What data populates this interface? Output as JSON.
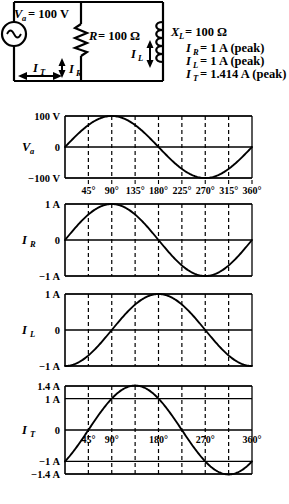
{
  "circuit": {
    "source": {
      "label_var": "V",
      "label_sub": "a",
      "label_value": "= 100 V",
      "icon": "ac-source-icon"
    },
    "resistor": {
      "label_var": "R",
      "label_value": "= 100 Ω",
      "icon": "resistor-icon"
    },
    "inductor": {
      "label_var": "X",
      "label_sub": "L",
      "label_value": "= 100 Ω",
      "icon": "inductor-icon"
    },
    "current_total": {
      "var": "I",
      "sub": "T"
    },
    "current_r": {
      "var": "I",
      "sub": "R"
    },
    "current_l": {
      "var": "I",
      "sub": "L"
    },
    "legend": [
      {
        "var": "I",
        "sub": "R",
        "text": "= 1 A (peak)"
      },
      {
        "var": "I",
        "sub": "L",
        "text": "= 1 A (peak)"
      },
      {
        "var": "I",
        "sub": "T",
        "text": "= 1.414 A (peak)"
      }
    ]
  },
  "chart_data": {
    "type": "line",
    "title": "",
    "xlabel": "",
    "x_unit": "degrees",
    "x": [
      0,
      45,
      90,
      135,
      180,
      225,
      270,
      315,
      360
    ],
    "xticklabels": [
      "45°",
      "90°",
      "135°",
      "180°",
      "225°",
      "270°",
      "315°",
      "360°"
    ],
    "xticks_values": [
      45,
      90,
      135,
      180,
      225,
      270,
      315,
      360
    ],
    "grid": true,
    "legend_position": "none",
    "panels": [
      {
        "name": "V_a",
        "ylabel_var": "V",
        "ylabel_sub": "a",
        "ylim": [
          -100,
          100
        ],
        "yticklabels": [
          "100 V",
          "0",
          "−100 V"
        ],
        "ytick_values": [
          100,
          0,
          -100
        ],
        "amplitude": 100,
        "phase_deg": 0,
        "waveform": "100*sin(theta)",
        "xticklabels_shown": true,
        "xticklabels": [
          "45°",
          "90°",
          "135°",
          "180°",
          "225°",
          "270°",
          "315°",
          "360°"
        ],
        "values": [
          0,
          70.7,
          100,
          70.7,
          0,
          -70.7,
          -100,
          -70.7,
          0
        ]
      },
      {
        "name": "I_R",
        "ylabel_var": "I",
        "ylabel_sub": "R",
        "ylim": [
          -1,
          1
        ],
        "yticklabels": [
          "1 A",
          "0",
          "−1 A"
        ],
        "ytick_values": [
          1,
          0,
          -1
        ],
        "amplitude": 1,
        "phase_deg": 0,
        "waveform": "1*sin(theta)",
        "xticklabels_shown": false,
        "values": [
          0,
          0.707,
          1,
          0.707,
          0,
          -0.707,
          -1,
          -0.707,
          0
        ]
      },
      {
        "name": "I_L",
        "ylabel_var": "I",
        "ylabel_sub": "L",
        "ylim": [
          -1,
          1
        ],
        "yticklabels": [
          "1 A",
          "0",
          "−1 A"
        ],
        "ytick_values": [
          1,
          0,
          -1
        ],
        "amplitude": 1,
        "phase_deg": -90,
        "waveform": "1*sin(theta-90°)",
        "xticklabels_shown": false,
        "values": [
          -1,
          -0.707,
          0,
          0.707,
          1,
          0.707,
          0,
          -0.707,
          -1
        ]
      },
      {
        "name": "I_T",
        "ylabel_var": "I",
        "ylabel_sub": "T",
        "ylim": [
          -1.4,
          1.4
        ],
        "yticklabels": [
          "1.4 A",
          "1 A",
          "0",
          "−1 A",
          "−1.4 A"
        ],
        "ytick_values": [
          1.4,
          1,
          0,
          -1,
          -1.4
        ],
        "amplitude": 1.414,
        "phase_deg": -45,
        "waveform": "1.414*sin(theta-45°)",
        "xticklabels_shown": true,
        "xticklabels": [
          "45°",
          "90°",
          "180°",
          "270°",
          "360°"
        ],
        "xticklabels_values": [
          45,
          90,
          180,
          270,
          360
        ],
        "values": [
          -1,
          0,
          1,
          1.414,
          1,
          0,
          -1,
          -1.414,
          -1
        ]
      }
    ]
  }
}
